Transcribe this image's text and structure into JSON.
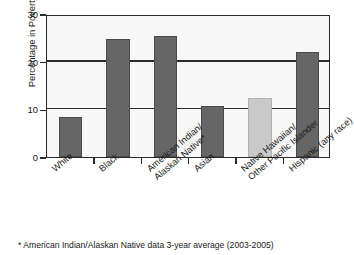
{
  "chart_data": {
    "type": "bar",
    "title": "",
    "subtitle": "",
    "xlabel": "",
    "ylabel": "Percentage in Poverty",
    "categories": [
      "White",
      "Black",
      "American Indian/ Alaskan Native*",
      "Asian",
      "Native Hawaiian/ Other Pacific Islander",
      "Hispanic (any race)"
    ],
    "category_lines": [
      [
        "White",
        ""
      ],
      [
        "Black",
        ""
      ],
      [
        "American Indian/",
        "Alaskan Native*"
      ],
      [
        "Asian",
        ""
      ],
      [
        "Native Hawaiian/",
        "Other Pacific Islander"
      ],
      [
        "Hispanic (any race)",
        ""
      ]
    ],
    "values": [
      8.4,
      24.8,
      25.4,
      10.8,
      12.3,
      22.1
    ],
    "bar_colors": [
      "#666666",
      "#666666",
      "#666666",
      "#666666",
      "#c9c9c9",
      "#666666"
    ],
    "ylim": [
      0,
      30
    ],
    "yticks": [
      0,
      10,
      20,
      30
    ],
    "ytick_labels": [
      "0",
      "10",
      "20",
      "30"
    ],
    "grid": true,
    "legend": "none",
    "annotations": [
      "* American Indian/Alaskan Native data 3-year average (2003-2005)"
    ]
  },
  "footnote": {
    "text": "* American Indian/Alaskan Native data 3-year average (2003-2005)"
  },
  "colors": {
    "bar_dark": "#666666",
    "bar_light": "#c9c9c9",
    "axis": "#2b2b2b",
    "plot_background": "#f7f7f7",
    "text": "#1a1a1a"
  }
}
